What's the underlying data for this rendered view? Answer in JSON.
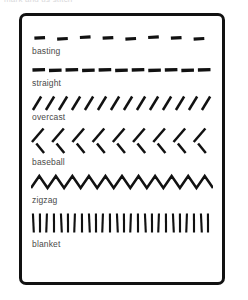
{
  "page": {
    "clipped_header_text": "mark and us stitch",
    "background_color": "#ffffff",
    "ink_color": "#111111",
    "label_color": "#4a4a4a",
    "border_color": "#111111"
  },
  "card": {
    "name": "stitch-sampler-card"
  },
  "diagram_data": {
    "type": "diagram",
    "title": "",
    "rows": [
      {
        "label": "basting",
        "pattern": "dashes-wide-gap",
        "count": 8,
        "dash_length": 11,
        "gap_length": 13,
        "stroke_width": 3.2
      },
      {
        "label": "straight",
        "pattern": "dashes-narrow-gap",
        "count": 11,
        "dash_length": 13,
        "gap_length": 4,
        "stroke_width": 3.4
      },
      {
        "label": "overcast",
        "pattern": "slants-forward",
        "count": 14,
        "slant": "/",
        "stroke_width": 2.6
      },
      {
        "label": "baseball",
        "pattern": "alternating-slants",
        "count": 9,
        "upper_slant": "/",
        "lower_slant": "\\",
        "stroke_width": 2.6
      },
      {
        "label": "zigzag",
        "pattern": "zigzag",
        "peaks": 11,
        "stroke_width": 2.6
      },
      {
        "label": "blanket",
        "pattern": "vertical-bars",
        "count": 26,
        "stroke_width": 2.2
      }
    ]
  }
}
